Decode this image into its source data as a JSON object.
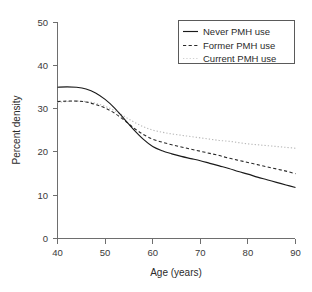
{
  "chart_data": {
    "type": "line",
    "title": "",
    "xlabel": "Age (years)",
    "ylabel": "Percent density",
    "xlim": [
      40,
      90
    ],
    "ylim": [
      0,
      50
    ],
    "xticks": [
      40,
      50,
      60,
      70,
      80,
      90
    ],
    "yticks": [
      0,
      10,
      20,
      30,
      40,
      50
    ],
    "xtick_labels": [
      "40",
      "50",
      "60",
      "70",
      "80",
      "90"
    ],
    "ytick_labels": [
      "0",
      "10",
      "20",
      "30",
      "40",
      "50"
    ],
    "grid": false,
    "legend_position": "top-right",
    "x": [
      40,
      42,
      44,
      46,
      48,
      50,
      52,
      54,
      56,
      58,
      60,
      62,
      64,
      66,
      68,
      70,
      72,
      74,
      76,
      78,
      80,
      82,
      84,
      86,
      88,
      90
    ],
    "series": [
      {
        "name": "Never PMH use",
        "style": "solid",
        "color": "#1a1a1a",
        "values": [
          35.0,
          35.1,
          35.0,
          34.6,
          33.7,
          32.2,
          30.2,
          27.7,
          25.2,
          23.0,
          21.3,
          20.3,
          19.6,
          19.0,
          18.5,
          18.0,
          17.4,
          16.8,
          16.2,
          15.5,
          14.9,
          14.2,
          13.6,
          13.0,
          12.4,
          11.8
        ]
      },
      {
        "name": "Former PMH use",
        "style": "dashed",
        "color": "#2a2a2a",
        "values": [
          31.7,
          31.8,
          31.8,
          31.6,
          31.0,
          30.2,
          29.0,
          27.4,
          25.6,
          24.1,
          23.0,
          22.3,
          21.7,
          21.2,
          20.7,
          20.2,
          19.7,
          19.2,
          18.6,
          18.1,
          17.6,
          17.1,
          16.6,
          16.1,
          15.6,
          15.0
        ]
      },
      {
        "name": "Current PMH use",
        "style": "dotted",
        "color": "#b9b9b9",
        "values": [
          31.5,
          31.7,
          31.8,
          31.7,
          31.3,
          30.6,
          29.6,
          28.3,
          27.0,
          25.9,
          25.1,
          24.6,
          24.2,
          23.9,
          23.6,
          23.3,
          23.0,
          22.7,
          22.5,
          22.2,
          21.9,
          21.7,
          21.5,
          21.3,
          21.1,
          20.9
        ]
      }
    ],
    "legend": [
      {
        "label": "Never PMH use",
        "style": "solid"
      },
      {
        "label": "Former PMH use",
        "style": "dashed"
      },
      {
        "label": "Current PMH use",
        "style": "dotted"
      }
    ],
    "annotations": []
  }
}
